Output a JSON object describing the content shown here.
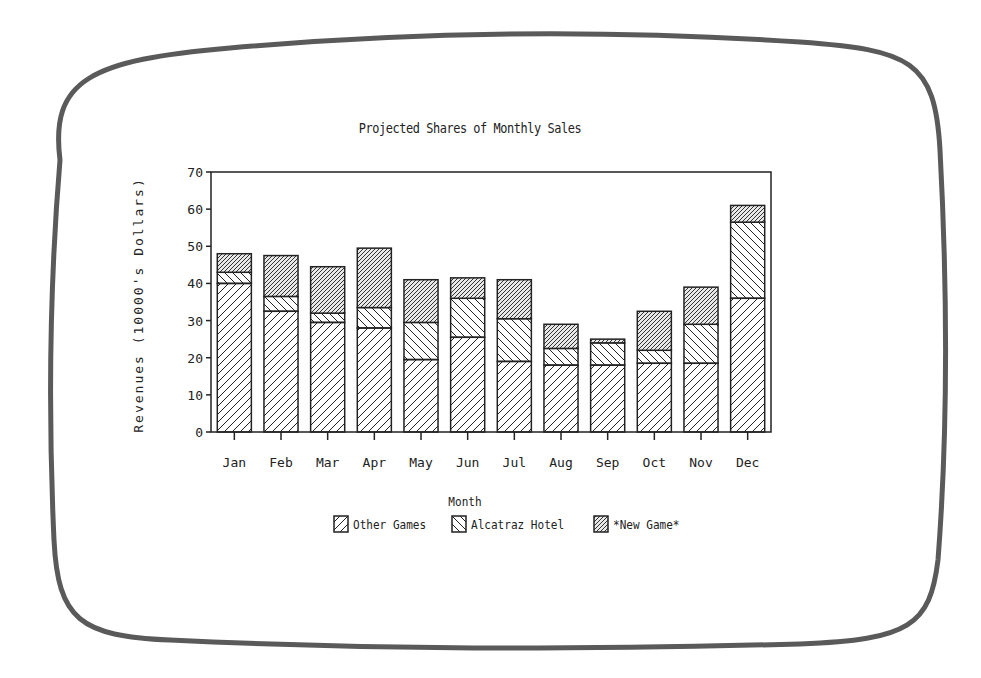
{
  "chart_data": {
    "type": "bar",
    "stacked": true,
    "title": "Projected Shares of Monthly Sales",
    "xlabel": "Month",
    "ylabel": "Revenues (10000's Dollars)",
    "ylim": [
      0,
      70
    ],
    "yticks": [
      0,
      10,
      20,
      30,
      40,
      50,
      60,
      70
    ],
    "grid": false,
    "legend_position": "bottom",
    "categories": [
      "Jan",
      "Feb",
      "Mar",
      "Apr",
      "May",
      "Jun",
      "Jul",
      "Aug",
      "Sep",
      "Oct",
      "Nov",
      "Dec"
    ],
    "series": [
      {
        "name": "Other Games",
        "pattern": "diagonal-forward",
        "values": [
          40,
          32.5,
          29.5,
          28,
          19.5,
          25.5,
          19,
          18,
          18,
          18.5,
          18.5,
          36
        ]
      },
      {
        "name": "Alcatraz Hotel",
        "pattern": "diagonal-backward",
        "values": [
          3,
          4,
          2.5,
          5.5,
          10,
          10.5,
          11.5,
          4.5,
          6,
          3.5,
          10.5,
          20.5
        ]
      },
      {
        "name": "*New Game*",
        "pattern": "dense-diagonal",
        "values": [
          5,
          11,
          12.5,
          16,
          11.5,
          5.5,
          10.5,
          6.5,
          1,
          10.5,
          10,
          4.5
        ]
      }
    ]
  },
  "colors": {
    "ink": "#222222",
    "frame": "#5a5a5a",
    "background": "#ffffff"
  }
}
